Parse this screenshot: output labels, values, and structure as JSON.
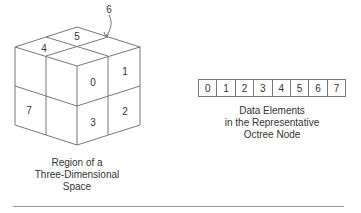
{
  "cube": {
    "labels": {
      "front_top_left": "",
      "front_top_right": "0",
      "side_top_right": "1",
      "side_bottom_right": "2",
      "front_bottom_right": "3",
      "top_left": "4",
      "top_back": "5",
      "hidden_callout": "6",
      "left_bottom": "7"
    },
    "caption_line1": "Region of a",
    "caption_line2": "Three-Dimensional",
    "caption_line3": "Space"
  },
  "array": {
    "cells": [
      "0",
      "1",
      "2",
      "3",
      "4",
      "5",
      "6",
      "7"
    ],
    "caption_line1": "Data Elements",
    "caption_line2": "in the Representative",
    "caption_line3": "Octree Node"
  },
  "colors": {
    "line": "#777777",
    "text": "#333333"
  }
}
